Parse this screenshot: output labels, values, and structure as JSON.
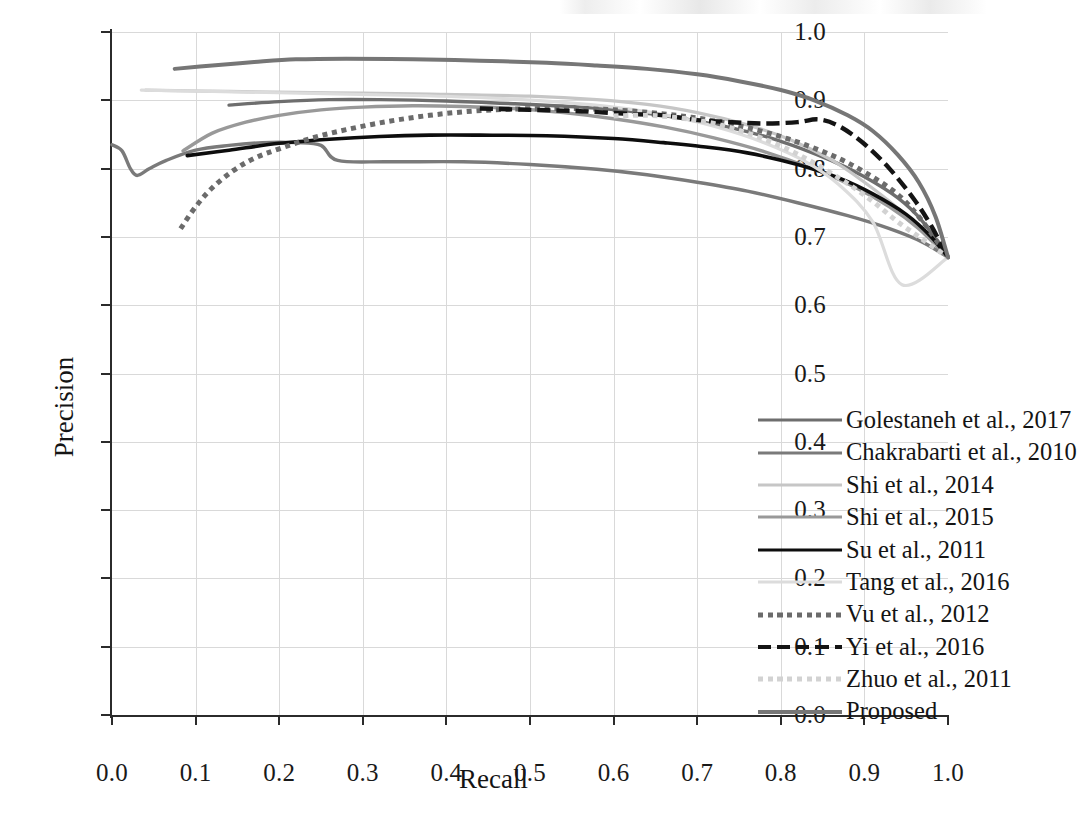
{
  "chart_data": {
    "type": "line",
    "title": "",
    "xlabel": "Recall",
    "ylabel": "Precision",
    "xlim": [
      0.0,
      1.0
    ],
    "ylim": [
      0.0,
      1.0
    ],
    "xticks": [
      "0.0",
      "0.1",
      "0.2",
      "0.3",
      "0.4",
      "0.5",
      "0.6",
      "0.7",
      "0.8",
      "0.9",
      "1.0"
    ],
    "yticks": [
      "0.0",
      "0.1",
      "0.2",
      "0.3",
      "0.4",
      "0.5",
      "0.6",
      "0.7",
      "0.8",
      "0.9",
      "1.0"
    ],
    "grid": true,
    "legend_position": "lower-right-inside",
    "convergence_point": [
      1.0,
      0.67
    ],
    "series": [
      {
        "name": "Golestaneh et al., 2017",
        "color": "#6e6e6e",
        "style": "solid",
        "width": 3.4,
        "points": [
          [
            0.14,
            0.893
          ],
          [
            0.2,
            0.898
          ],
          [
            0.26,
            0.901
          ],
          [
            0.32,
            0.901
          ],
          [
            0.4,
            0.899
          ],
          [
            0.48,
            0.895
          ],
          [
            0.56,
            0.89
          ],
          [
            0.62,
            0.884
          ],
          [
            0.68,
            0.874
          ],
          [
            0.74,
            0.86
          ],
          [
            0.8,
            0.84
          ],
          [
            0.86,
            0.812
          ],
          [
            0.9,
            0.788
          ],
          [
            0.94,
            0.757
          ],
          [
            0.97,
            0.722
          ],
          [
            1.0,
            0.67
          ]
        ]
      },
      {
        "name": "Chakrabarti et al., 2010",
        "color": "#7a7a7a",
        "style": "solid",
        "width": 3.4,
        "points": [
          [
            0.0,
            0.835
          ],
          [
            0.012,
            0.826
          ],
          [
            0.022,
            0.8
          ],
          [
            0.03,
            0.79
          ],
          [
            0.045,
            0.8
          ],
          [
            0.065,
            0.812
          ],
          [
            0.1,
            0.827
          ],
          [
            0.14,
            0.834
          ],
          [
            0.18,
            0.838
          ],
          [
            0.22,
            0.838
          ],
          [
            0.25,
            0.834
          ],
          [
            0.27,
            0.812
          ],
          [
            0.33,
            0.81
          ],
          [
            0.42,
            0.81
          ],
          [
            0.5,
            0.806
          ],
          [
            0.58,
            0.799
          ],
          [
            0.64,
            0.791
          ],
          [
            0.7,
            0.78
          ],
          [
            0.76,
            0.767
          ],
          [
            0.82,
            0.75
          ],
          [
            0.88,
            0.731
          ],
          [
            0.93,
            0.712
          ],
          [
            0.97,
            0.692
          ],
          [
            1.0,
            0.67
          ]
        ]
      },
      {
        "name": "Shi et al., 2014",
        "color": "#c6c6c6",
        "style": "solid",
        "width": 3.2,
        "points": [
          [
            0.04,
            0.915
          ],
          [
            0.14,
            0.913
          ],
          [
            0.26,
            0.911
          ],
          [
            0.38,
            0.909
          ],
          [
            0.5,
            0.906
          ],
          [
            0.58,
            0.901
          ],
          [
            0.64,
            0.894
          ],
          [
            0.7,
            0.882
          ],
          [
            0.76,
            0.864
          ],
          [
            0.81,
            0.843
          ],
          [
            0.86,
            0.813
          ],
          [
            0.9,
            0.78
          ],
          [
            0.94,
            0.742
          ],
          [
            0.97,
            0.708
          ],
          [
            1.0,
            0.67
          ]
        ]
      },
      {
        "name": "Shi et al., 2015",
        "color": "#999999",
        "style": "solid",
        "width": 3.4,
        "points": [
          [
            0.085,
            0.826
          ],
          [
            0.12,
            0.852
          ],
          [
            0.16,
            0.868
          ],
          [
            0.2,
            0.878
          ],
          [
            0.25,
            0.886
          ],
          [
            0.3,
            0.89
          ],
          [
            0.36,
            0.892
          ],
          [
            0.42,
            0.891
          ],
          [
            0.48,
            0.888
          ],
          [
            0.54,
            0.882
          ],
          [
            0.6,
            0.873
          ],
          [
            0.66,
            0.861
          ],
          [
            0.72,
            0.845
          ],
          [
            0.78,
            0.825
          ],
          [
            0.84,
            0.799
          ],
          [
            0.89,
            0.772
          ],
          [
            0.93,
            0.744
          ],
          [
            0.965,
            0.712
          ],
          [
            1.0,
            0.67
          ]
        ]
      },
      {
        "name": "Su et al., 2011",
        "color": "#0d0d0d",
        "style": "solid",
        "width": 3.6,
        "points": [
          [
            0.09,
            0.819
          ],
          [
            0.14,
            0.827
          ],
          [
            0.2,
            0.837
          ],
          [
            0.26,
            0.843
          ],
          [
            0.32,
            0.847
          ],
          [
            0.38,
            0.849
          ],
          [
            0.44,
            0.849
          ],
          [
            0.52,
            0.848
          ],
          [
            0.6,
            0.844
          ],
          [
            0.66,
            0.838
          ],
          [
            0.7,
            0.833
          ],
          [
            0.76,
            0.823
          ],
          [
            0.82,
            0.806
          ],
          [
            0.87,
            0.786
          ],
          [
            0.91,
            0.763
          ],
          [
            0.95,
            0.733
          ],
          [
            0.98,
            0.7
          ],
          [
            1.0,
            0.67
          ]
        ]
      },
      {
        "name": "Tang et al., 2016",
        "color": "#dcdcdc",
        "style": "solid",
        "width": 3.2,
        "points": [
          [
            0.035,
            0.915
          ],
          [
            0.12,
            0.913
          ],
          [
            0.24,
            0.91
          ],
          [
            0.36,
            0.907
          ],
          [
            0.46,
            0.903
          ],
          [
            0.54,
            0.897
          ],
          [
            0.6,
            0.89
          ],
          [
            0.66,
            0.879
          ],
          [
            0.72,
            0.862
          ],
          [
            0.78,
            0.838
          ],
          [
            0.83,
            0.81
          ],
          [
            0.87,
            0.776
          ],
          [
            0.91,
            0.722
          ],
          [
            0.945,
            0.63
          ],
          [
            1.0,
            0.67
          ]
        ]
      },
      {
        "name": "Vu et al., 2012",
        "color": "#6b6b6b",
        "style": "dotted",
        "width": 5.0,
        "points": [
          [
            0.082,
            0.712
          ],
          [
            0.1,
            0.744
          ],
          [
            0.12,
            0.772
          ],
          [
            0.145,
            0.797
          ],
          [
            0.17,
            0.815
          ],
          [
            0.2,
            0.829
          ],
          [
            0.24,
            0.845
          ],
          [
            0.28,
            0.857
          ],
          [
            0.33,
            0.869
          ],
          [
            0.38,
            0.878
          ],
          [
            0.43,
            0.884
          ],
          [
            0.48,
            0.887
          ],
          [
            0.54,
            0.888
          ],
          [
            0.6,
            0.886
          ],
          [
            0.66,
            0.88
          ],
          [
            0.71,
            0.872
          ],
          [
            0.76,
            0.86
          ],
          [
            0.81,
            0.843
          ],
          [
            0.86,
            0.82
          ],
          [
            0.9,
            0.795
          ],
          [
            0.94,
            0.762
          ],
          [
            0.97,
            0.722
          ],
          [
            1.0,
            0.67
          ]
        ]
      },
      {
        "name": "Yi et al., 2016",
        "color": "#141414",
        "style": "dashed",
        "width": 4.4,
        "points": [
          [
            0.44,
            0.888
          ],
          [
            0.5,
            0.886
          ],
          [
            0.56,
            0.884
          ],
          [
            0.62,
            0.88
          ],
          [
            0.66,
            0.878
          ],
          [
            0.7,
            0.871
          ],
          [
            0.74,
            0.868
          ],
          [
            0.78,
            0.866
          ],
          [
            0.82,
            0.868
          ],
          [
            0.845,
            0.872
          ],
          [
            0.87,
            0.862
          ],
          [
            0.9,
            0.836
          ],
          [
            0.93,
            0.8
          ],
          [
            0.96,
            0.754
          ],
          [
            0.98,
            0.716
          ],
          [
            1.0,
            0.67
          ]
        ]
      },
      {
        "name": "Zhuo et al., 2011",
        "color": "#d2d2d2",
        "style": "dotted",
        "width": 5.0,
        "points": [
          [
            0.6,
            0.877
          ],
          [
            0.64,
            0.878
          ],
          [
            0.68,
            0.874
          ],
          [
            0.72,
            0.866
          ],
          [
            0.76,
            0.852
          ],
          [
            0.8,
            0.833
          ],
          [
            0.84,
            0.808
          ],
          [
            0.88,
            0.778
          ],
          [
            0.91,
            0.752
          ],
          [
            0.94,
            0.722
          ],
          [
            0.97,
            0.696
          ],
          [
            1.0,
            0.67
          ]
        ]
      },
      {
        "name": "Proposed",
        "color": "#767676",
        "style": "solid",
        "width": 4.0,
        "points": [
          [
            0.075,
            0.946
          ],
          [
            0.12,
            0.951
          ],
          [
            0.17,
            0.956
          ],
          [
            0.22,
            0.96
          ],
          [
            0.28,
            0.961
          ],
          [
            0.36,
            0.96
          ],
          [
            0.44,
            0.958
          ],
          [
            0.52,
            0.955
          ],
          [
            0.58,
            0.951
          ],
          [
            0.64,
            0.946
          ],
          [
            0.7,
            0.938
          ],
          [
            0.75,
            0.928
          ],
          [
            0.8,
            0.915
          ],
          [
            0.84,
            0.9
          ],
          [
            0.88,
            0.878
          ],
          [
            0.91,
            0.855
          ],
          [
            0.94,
            0.82
          ],
          [
            0.965,
            0.78
          ],
          [
            0.985,
            0.73
          ],
          [
            1.0,
            0.67
          ]
        ]
      }
    ]
  }
}
